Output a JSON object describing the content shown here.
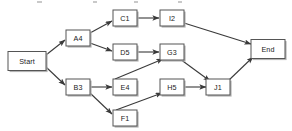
{
  "diagram": {
    "title": "",
    "colors": {
      "node_fill": "#ffffff",
      "node_stroke": "#555555",
      "node_shadow": "#b4b4b4",
      "edge_stroke": "#3a3a3a",
      "label_text": "#1a1a1a",
      "background": "#ffffff"
    },
    "nodes": [
      {
        "id": "start",
        "label": "Start",
        "x": 27,
        "y": 61,
        "w": 38,
        "h": 19
      },
      {
        "id": "a4",
        "label": "A4",
        "x": 78,
        "y": 38,
        "w": 24,
        "h": 16
      },
      {
        "id": "b3",
        "label": "B3",
        "x": 78,
        "y": 87,
        "w": 24,
        "h": 16
      },
      {
        "id": "c1",
        "label": "C1",
        "x": 125,
        "y": 18,
        "w": 24,
        "h": 16
      },
      {
        "id": "d5",
        "label": "D5",
        "x": 125,
        "y": 52,
        "w": 24,
        "h": 16
      },
      {
        "id": "e4",
        "label": "E4",
        "x": 125,
        "y": 87,
        "w": 24,
        "h": 16
      },
      {
        "id": "f1",
        "label": "F1",
        "x": 125,
        "y": 118,
        "w": 24,
        "h": 16
      },
      {
        "id": "i2",
        "label": "I2",
        "x": 172,
        "y": 18,
        "w": 24,
        "h": 16
      },
      {
        "id": "g3",
        "label": "G3",
        "x": 172,
        "y": 52,
        "w": 24,
        "h": 16
      },
      {
        "id": "h5",
        "label": "H5",
        "x": 172,
        "y": 87,
        "w": 24,
        "h": 16
      },
      {
        "id": "j1",
        "label": "J1",
        "x": 218,
        "y": 87,
        "w": 24,
        "h": 16
      },
      {
        "id": "end",
        "label": "End",
        "x": 268,
        "y": 49,
        "w": 34,
        "h": 19
      }
    ],
    "edges": [
      {
        "from": "start",
        "to": "a4",
        "x1": 46,
        "y1": 55,
        "x2": 65,
        "y2": 40
      },
      {
        "from": "start",
        "to": "b3",
        "x1": 46,
        "y1": 67,
        "x2": 65,
        "y2": 85
      },
      {
        "from": "a4",
        "to": "c1",
        "x1": 90,
        "y1": 33,
        "x2": 112,
        "y2": 21
      },
      {
        "from": "a4",
        "to": "d5",
        "x1": 90,
        "y1": 43,
        "x2": 112,
        "y2": 51
      },
      {
        "from": "b3",
        "to": "e4",
        "x1": 90,
        "y1": 87,
        "x2": 112,
        "y2": 87
      },
      {
        "from": "b3",
        "to": "f1",
        "x1": 90,
        "y1": 93,
        "x2": 112,
        "y2": 114
      },
      {
        "from": "c1",
        "to": "i2",
        "x1": 137,
        "y1": 18,
        "x2": 159,
        "y2": 18
      },
      {
        "from": "d5",
        "to": "g3",
        "x1": 137,
        "y1": 52,
        "x2": 159,
        "y2": 52
      },
      {
        "from": "e4",
        "to": "g3",
        "x1": 115,
        "y1": 79,
        "x2": 163,
        "y2": 59
      },
      {
        "from": "f1",
        "to": "h5",
        "x1": 116,
        "y1": 110,
        "x2": 162,
        "y2": 93
      },
      {
        "from": "g3",
        "to": "j1",
        "x1": 180,
        "y1": 59,
        "x2": 210,
        "y2": 81
      },
      {
        "from": "h5",
        "to": "j1",
        "x1": 184,
        "y1": 87,
        "x2": 206,
        "y2": 87
      },
      {
        "from": "i2",
        "to": "end",
        "x1": 184,
        "y1": 23,
        "x2": 251,
        "y2": 44
      },
      {
        "from": "j1",
        "to": "end",
        "x1": 228,
        "y1": 81,
        "x2": 253,
        "y2": 57
      }
    ]
  }
}
